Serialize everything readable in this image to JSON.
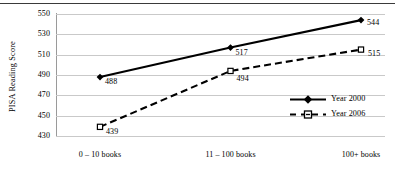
{
  "figure": {
    "y_axis_title": "PISA Reading Score",
    "top_rule": true
  },
  "chart_data": {
    "type": "line",
    "title": "",
    "xlabel": "",
    "ylabel": "PISA Reading Score",
    "categories": [
      "0 – 10 books",
      "11 – 100 books",
      "100+ books"
    ],
    "series": [
      {
        "name": "Year 2000",
        "values": [
          488,
          517,
          544
        ],
        "style": "solid",
        "marker": "filled-diamond",
        "color": "#000000"
      },
      {
        "name": "Year 2006",
        "values": [
          439,
          494,
          515
        ],
        "style": "dashed",
        "marker": "open-square",
        "color": "#000000"
      }
    ],
    "ylim": [
      430,
      550
    ],
    "yticks": [
      550,
      530,
      510,
      490,
      470,
      450,
      430
    ],
    "grid": true,
    "legend_position": "inside-right",
    "data_labels": {
      "Year 2000": [
        "488",
        "517",
        "544"
      ],
      "Year 2006": [
        "439",
        "494",
        "515"
      ]
    }
  },
  "colors": {
    "line": "#000000",
    "grid": "#c9c9c9",
    "axis": "#9a9a9a",
    "rule": "#3a3a3a"
  }
}
